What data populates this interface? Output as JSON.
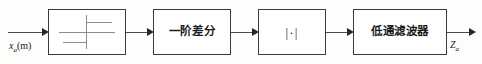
{
  "diagram": {
    "type": "signal-processing-block-diagram",
    "width": 482,
    "height": 64,
    "background_color": "#fdfdfc",
    "line_color": "#3b3b3b",
    "text_color": "#1b1b1b"
  },
  "input": {
    "label_var": "x",
    "label_sub": "a",
    "label_arg": "(m)",
    "label_full": "x_a(m)"
  },
  "output": {
    "label_var": "Z",
    "label_sub": "a",
    "label_full": "Z_a"
  },
  "blocks": [
    {
      "id": "filterbank",
      "label": "",
      "icon": "filter-response-symbol",
      "description": "filter response schematic symbol"
    },
    {
      "id": "difference",
      "label": "一阶差分",
      "icon": "",
      "description": "first-order difference"
    },
    {
      "id": "absolute",
      "label": "|·|",
      "icon": "",
      "description": "absolute value"
    },
    {
      "id": "lowpass",
      "label": "低通滤波器",
      "icon": "",
      "description": "low-pass filter"
    }
  ]
}
